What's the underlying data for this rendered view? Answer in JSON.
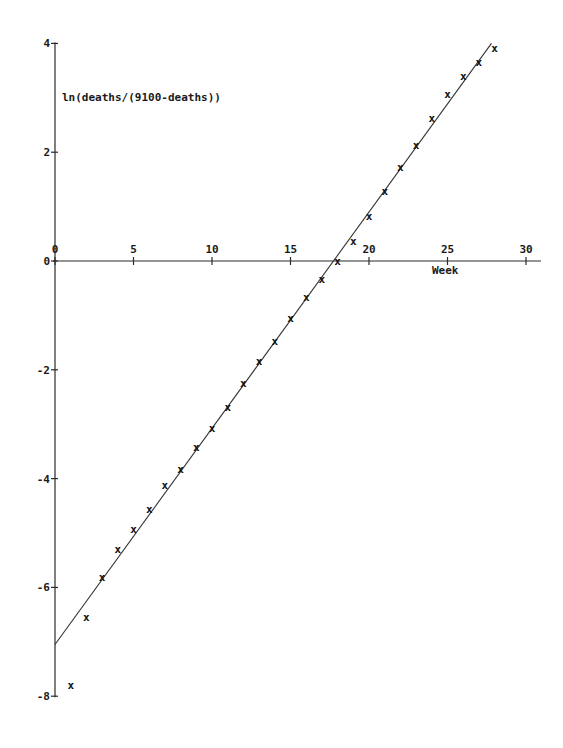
{
  "chart_data": {
    "type": "scatter",
    "title": "",
    "xlabel": "Week",
    "ylabel": "ln(deaths/(9100-deaths))",
    "xlim": [
      0,
      31
    ],
    "ylim": [
      -8,
      4
    ],
    "grid": false,
    "legend": null,
    "x_ticks": [
      0,
      5,
      10,
      15,
      20,
      25,
      30
    ],
    "y_ticks": [
      4,
      2,
      0,
      -2,
      -4,
      -6,
      -8
    ],
    "x_tick_labels": [
      "0",
      "5",
      "10",
      "15",
      "20",
      "25",
      "30"
    ],
    "y_tick_labels": [
      "4",
      "2",
      "0",
      "-2",
      "-4",
      "-6",
      "-8"
    ],
    "marker": "x",
    "series": [
      {
        "name": "observed",
        "style": "markers",
        "x": [
          1,
          2,
          3,
          4,
          5,
          6,
          7,
          8,
          9,
          10,
          11,
          12,
          13,
          14,
          15,
          16,
          17,
          18,
          19,
          20,
          21,
          22,
          23,
          24,
          25,
          26,
          27,
          28
        ],
        "y": [
          -7.8,
          -6.55,
          -5.8,
          -5.3,
          -4.93,
          -4.55,
          -4.12,
          -3.82,
          -3.42,
          -3.07,
          -2.68,
          -2.24,
          -1.84,
          -1.47,
          -1.05,
          -0.66,
          -0.33,
          0.0,
          0.37,
          0.83,
          1.29,
          1.73,
          2.13,
          2.63,
          3.07,
          3.4,
          3.66,
          3.92
        ]
      },
      {
        "name": "fitted line",
        "style": "line",
        "x": [
          0,
          27.8
        ],
        "y": [
          -7.05,
          4.0
        ]
      }
    ]
  }
}
